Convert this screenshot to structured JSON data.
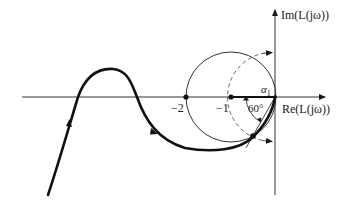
{
  "diagram": {
    "type": "nyquist-plot",
    "axes": {
      "x_label": "Re(L(jω))",
      "y_label": "Im(L(jω))"
    },
    "ticks": [
      {
        "value": -2,
        "label": "−2"
      },
      {
        "value": -1,
        "label": "−1"
      }
    ],
    "annotations": {
      "angle": "60°",
      "alpha": "α",
      "alpha_sub": "1"
    },
    "elements": [
      {
        "name": "nyquist-curve",
        "style": "thick solid",
        "description": "L(jω) locus with direction arrows"
      },
      {
        "name": "circle-center-minus-one",
        "style": "solid",
        "center": [
          -1,
          0
        ],
        "radius": 1
      },
      {
        "name": "unit-circle",
        "style": "dashed",
        "center": [
          0,
          0
        ],
        "radius": 1
      },
      {
        "name": "critical-point",
        "point": [
          -1,
          0
        ]
      },
      {
        "name": "point-minus-two",
        "point": [
          -2,
          0
        ]
      },
      {
        "name": "crossover-point",
        "description": "intersection of locus with unit circle at 60° below real axis"
      }
    ]
  }
}
